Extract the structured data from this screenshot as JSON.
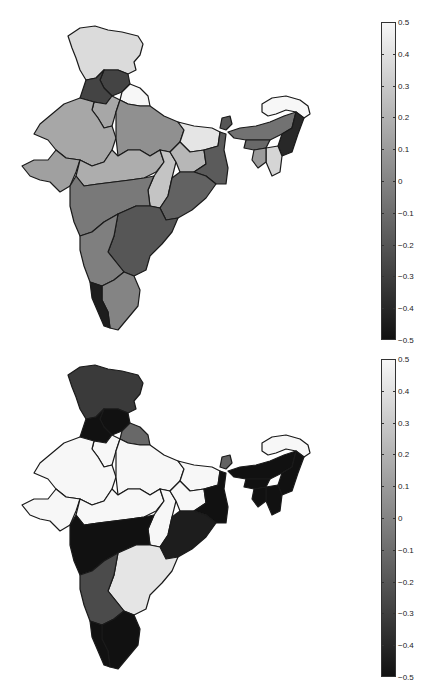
{
  "figure": {
    "panels": [
      {
        "id": "top",
        "colorbar": {
          "min": -0.5,
          "max": 0.5,
          "ticks": [
            "0.5",
            "0.4",
            "0.3",
            "0.2",
            "0.1",
            "0",
            "-0.1",
            "-0.2",
            "-0.3",
            "-0.4",
            "-0.5"
          ],
          "colormap": "gray",
          "color_min": "#111111",
          "color_max": "#f7f7f7"
        },
        "regions": {
          "jammu_kashmir": 0.38,
          "himachal": -0.28,
          "punjab": -0.28,
          "uttarakhand": 0.5,
          "haryana": 0.15,
          "rajasthan": 0.15,
          "uttar_pradesh": 0.05,
          "bihar": 0.42,
          "gujarat": 0.12,
          "madhya_pradesh": 0.18,
          "chhattisgarh": 0.28,
          "jharkhand": 0.22,
          "west_bengal": -0.18,
          "odisha": -0.15,
          "maharashtra": -0.05,
          "telangana_andhra": -0.2,
          "karnataka": -0.02,
          "tamil_nadu": 0.0,
          "kerala": -0.45,
          "sikkim": -0.2,
          "arunachal": 0.5,
          "assam": -0.08,
          "meghalaya": -0.12,
          "nagaland_manipur": -0.4,
          "mizoram": 0.35,
          "tripura": 0.1
        }
      },
      {
        "id": "bottom",
        "colorbar": {
          "min": -0.5,
          "max": 0.5,
          "ticks": [
            "0.5",
            "0.4",
            "0.3",
            "0.2",
            "0.1",
            "0",
            "-0.1",
            "-0.2",
            "-0.3",
            "-0.4",
            "-0.5"
          ],
          "colormap": "gray",
          "color_min": "#111111",
          "color_max": "#f7f7f7"
        },
        "regions": {
          "jammu_kashmir": -0.32,
          "himachal": -0.5,
          "punjab": -0.5,
          "uttarakhand": -0.12,
          "haryana": 0.5,
          "rajasthan": 0.5,
          "uttar_pradesh": 0.5,
          "bihar": 0.5,
          "gujarat": 0.5,
          "madhya_pradesh": 0.5,
          "chhattisgarh": 0.5,
          "jharkhand": 0.5,
          "west_bengal": -0.5,
          "odisha": -0.45,
          "maharashtra": -0.5,
          "telangana_andhra": 0.42,
          "karnataka": -0.25,
          "tamil_nadu": -0.5,
          "kerala": -0.5,
          "sikkim": -0.15,
          "arunachal": 0.5,
          "assam": -0.5,
          "meghalaya": -0.5,
          "nagaland_manipur": -0.5,
          "mizoram": -0.5,
          "tripura": -0.5
        }
      }
    ]
  }
}
